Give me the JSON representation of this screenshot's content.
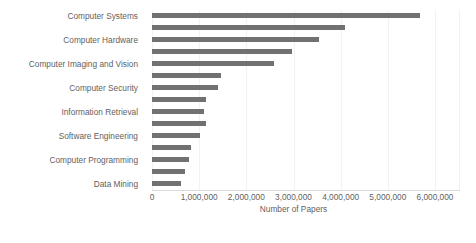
{
  "chart_data": {
    "type": "bar",
    "orientation": "horizontal",
    "title": "",
    "xlabel": "Number of Papers",
    "ylabel": "",
    "xlim": [
      0,
      6000000
    ],
    "xticks": [
      0,
      1000000,
      2000000,
      3000000,
      4000000,
      5000000,
      6000000
    ],
    "xtick_labels": [
      "0",
      "1,000,000",
      "2,000,000",
      "3,000,000",
      "4,000,000",
      "5,000,000",
      "6,000,000"
    ],
    "grid": true,
    "legend": false,
    "bar_color": "#717171",
    "visible_category_labels": [
      "Computer Systems",
      "Computer Hardware",
      "Computer Imaging and Vision",
      "Computer Security",
      "Information Retrieval",
      "Software Engineering",
      "Computer Programming",
      "Data Mining"
    ],
    "bars": [
      {
        "label": "Computer Systems",
        "label_shown": true,
        "value": 5680000
      },
      {
        "label": "",
        "label_shown": false,
        "value": 4090000
      },
      {
        "label": "Computer Hardware",
        "label_shown": true,
        "value": 3540000
      },
      {
        "label": "",
        "label_shown": false,
        "value": 2970000
      },
      {
        "label": "Computer Imaging and Vision",
        "label_shown": true,
        "value": 2580000
      },
      {
        "label": "",
        "label_shown": false,
        "value": 1460000
      },
      {
        "label": "Computer Security",
        "label_shown": true,
        "value": 1400000
      },
      {
        "label": "",
        "label_shown": false,
        "value": 1150000
      },
      {
        "label": "Information Retrieval",
        "label_shown": true,
        "value": 1100000
      },
      {
        "label": "",
        "label_shown": false,
        "value": 1140000
      },
      {
        "label": "Software Engineering",
        "label_shown": true,
        "value": 1020000
      },
      {
        "label": "",
        "label_shown": false,
        "value": 830000
      },
      {
        "label": "Computer Programming",
        "label_shown": true,
        "value": 780000
      },
      {
        "label": "",
        "label_shown": false,
        "value": 700000
      },
      {
        "label": "Data Mining",
        "label_shown": true,
        "value": 610000
      }
    ]
  }
}
